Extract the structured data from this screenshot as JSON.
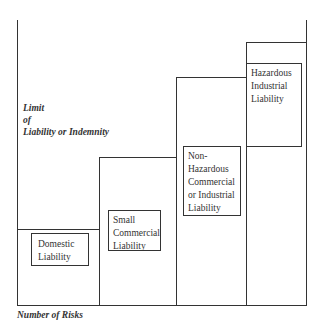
{
  "diagram": {
    "y_axis_label": [
      "Limit",
      "of",
      "Liability or Indemnity"
    ],
    "x_axis_label": "Number of Risks",
    "steps": [
      {
        "label": [
          "Domestic",
          "Liability"
        ]
      },
      {
        "label": [
          "Small",
          "Commercial",
          "Liability"
        ]
      },
      {
        "label": [
          "Non-",
          "Hazardous",
          "Commercial",
          "or Industrial",
          "Liability"
        ]
      },
      {
        "label": [
          "Hazardous",
          "Industrial",
          "Liability"
        ]
      }
    ]
  }
}
